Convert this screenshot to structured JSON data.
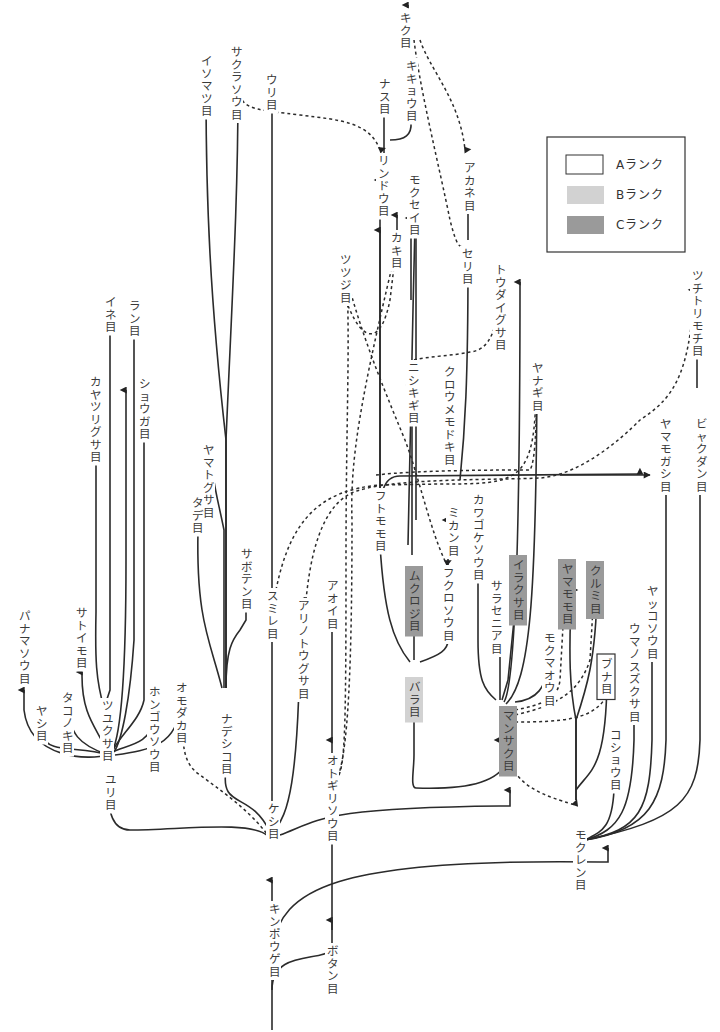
{
  "legend": {
    "items": [
      {
        "rank": "A",
        "label": "Aランク",
        "fill": "#ffffff"
      },
      {
        "rank": "B",
        "label": "Bランク",
        "fill": "#d2d2d2"
      },
      {
        "rank": "C",
        "label": "Cランク",
        "fill": "#9a9a9a"
      }
    ]
  },
  "nodes": {
    "kiku": {
      "label": "キク目"
    },
    "kikyou": {
      "label": "キキョウ目"
    },
    "nasu": {
      "label": "ナス目"
    },
    "rindou": {
      "label": "リンドウ目"
    },
    "mokusei": {
      "label": "モクセイ目"
    },
    "akane": {
      "label": "アカネ目"
    },
    "kaki": {
      "label": "カキ目"
    },
    "tsutsuji": {
      "label": "ツツジ目"
    },
    "isomatsu": {
      "label": "イソマツ目"
    },
    "sakurasou": {
      "label": "サクラソウ目"
    },
    "uri": {
      "label": "ウリ目"
    },
    "seri": {
      "label": "セリ目"
    },
    "toudaigusa": {
      "label": "トウダイグサ目"
    },
    "tsuchitorimochi": {
      "label": "ツチトリモチ目"
    },
    "nishikigi": {
      "label": "ニシキギ目"
    },
    "kuroumemodoki": {
      "label": "クロウメモドキ目"
    },
    "yanagi": {
      "label": "ヤナギ目"
    },
    "yamamogashi": {
      "label": "ヤマモガシ目"
    },
    "byakudan": {
      "label": "ビャクダン目"
    },
    "futomomo": {
      "label": "フトモモ目"
    },
    "mikan": {
      "label": "ミカン目"
    },
    "kawagokesou": {
      "label": "カワゴケソウ目"
    },
    "mukuroji": {
      "label": "ムクロジ目",
      "rank": "C"
    },
    "fukurosou": {
      "label": "フクロソウ目"
    },
    "sarasenia": {
      "label": "サラセニア目"
    },
    "irakusa": {
      "label": "イラクサ目",
      "rank": "C"
    },
    "yamamomo": {
      "label": "ヤマモモ目",
      "rank": "C"
    },
    "kurumi": {
      "label": "クルミ目",
      "rank": "C"
    },
    "mokumaou": {
      "label": "モクマオウ目"
    },
    "yakkosou": {
      "label": "ヤッコソウ目"
    },
    "umanosuzukusa": {
      "label": "ウマノスズクサ目"
    },
    "buna": {
      "label": "ブナ目",
      "rank": "A"
    },
    "bara": {
      "label": "バラ目",
      "rank": "B"
    },
    "mansaku": {
      "label": "マンサク目",
      "rank": "C"
    },
    "koshou": {
      "label": "コショウ目"
    },
    "mokuren": {
      "label": "モクレン目"
    },
    "ine": {
      "label": "イネ目"
    },
    "ran": {
      "label": "ラン目"
    },
    "kayatsurigusa": {
      "label": "カヤツリグサ目"
    },
    "shouga": {
      "label": "ショウガ目"
    },
    "yamatogusa": {
      "label": "ヤマトグサ目"
    },
    "tade": {
      "label": "タデ目"
    },
    "saboten": {
      "label": "サボテン目"
    },
    "sumire": {
      "label": "スミレ目"
    },
    "arinotougusa": {
      "label": "アリノトウグサ目"
    },
    "aoi": {
      "label": "アオイ目"
    },
    "panamasou": {
      "label": "パナマソウ目"
    },
    "satoimo": {
      "label": "サトイモ目"
    },
    "takonoki": {
      "label": "タコノキ目"
    },
    "yashi": {
      "label": "ヤシ目"
    },
    "tsuyukusa": {
      "label": "ツユクサ目"
    },
    "hongousou": {
      "label": "ホンゴウソウ目"
    },
    "omodaka": {
      "label": "オモダカ目"
    },
    "nadeshiko": {
      "label": "ナデシコ目"
    },
    "yuri": {
      "label": "ユリ目"
    },
    "keshi": {
      "label": "ケシ目"
    },
    "otogirisou": {
      "label": "オトギリソウ目"
    },
    "kinpouge": {
      "label": "キンポウゲ目"
    },
    "botan": {
      "label": "ボタン目"
    }
  }
}
